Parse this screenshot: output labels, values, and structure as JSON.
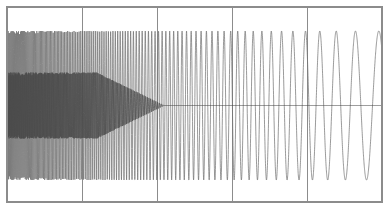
{
  "figure": {
    "width": 388,
    "height": 211,
    "background": "#ffffff"
  },
  "axes": {
    "left": 7,
    "top": 7,
    "right": 382,
    "bottom": 202,
    "border_color": "#8c8c8c",
    "border_width": 2,
    "gridlines_x": [
      82,
      157,
      232,
      307
    ],
    "grid_color": "#8c8c8c",
    "grid_width": 1.2,
    "ticks_visible": false,
    "tick_labels_x": [],
    "tick_labels_y": [],
    "title": "",
    "xlabel": "",
    "ylabel": ""
  },
  "chart_data": {
    "type": "line",
    "title": "",
    "xlabel": "",
    "ylabel": "",
    "xlim": [
      0,
      1
    ],
    "ylim": [
      -1.25,
      1.25
    ],
    "grid": true,
    "grid_axis": "x",
    "legend": null,
    "legend_position": "none",
    "annotations": [],
    "series": [
      {
        "name": "chirp",
        "color": "#6e6e6e",
        "line_width": 0.7,
        "samples": 4000,
        "waveform": "chirp",
        "frequency_start_hz": 420,
        "frequency_end_hz": 14,
        "frequency_sweep": "hyperbolic-decreasing",
        "amplitude": 1.0,
        "phase": 0
      },
      {
        "name": "inner-band",
        "color": "#4a4a4a",
        "line_width": 0.7,
        "samples": 4000,
        "waveform": "chirp",
        "frequency_start_hz": 640,
        "frequency_end_hz": 40,
        "frequency_sweep": "hyperbolic-decreasing",
        "amplitude": 0.52,
        "amplitude_fade_start": 0.24,
        "amplitude_fade_end": 0.42,
        "phase": 1.5708
      }
    ],
    "envelope": {
      "upper_y_px": 31,
      "lower_y_px": 180,
      "inner_upper_y_px": 84,
      "inner_lower_y_px": 150
    }
  }
}
